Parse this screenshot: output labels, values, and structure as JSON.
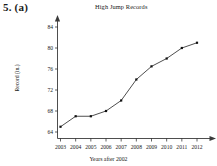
{
  "problem": {
    "label": "5.  (a)"
  },
  "chart_data": {
    "type": "line",
    "title": "High Jump Records",
    "xlabel": "Years after 2002",
    "ylabel": "Record (in.)",
    "categories": [
      "2003",
      "2004",
      "2005",
      "2006",
      "2007",
      "2008",
      "2009",
      "2010",
      "2011",
      "2012"
    ],
    "x": [
      2003,
      2004,
      2005,
      2006,
      2007,
      2008,
      2009,
      2010,
      2011,
      2012
    ],
    "values": [
      65,
      67,
      67,
      68,
      70,
      74,
      76.5,
      78,
      80,
      81
    ],
    "series": [
      {
        "name": "High Jump Record",
        "values": [
          65,
          67,
          67,
          68,
          70,
          74,
          76.5,
          78,
          80,
          81
        ]
      }
    ],
    "ytick_labels": [
      "64",
      "68",
      "72",
      "76",
      "80",
      "84"
    ],
    "ytick_values": [
      64,
      68,
      72,
      76,
      80,
      84
    ],
    "ylim": [
      62.5,
      85.5
    ],
    "xlim": [
      2002.6,
      2012.9
    ],
    "grid": false,
    "legend": false,
    "marker": "square",
    "line_color": "#3a3a3a",
    "marker_color": "#111111",
    "axis_color": "#3a3a3a"
  },
  "axes": {
    "y_arrow": "up-arrow-icon",
    "x_arrow": "right-arrow-icon"
  }
}
